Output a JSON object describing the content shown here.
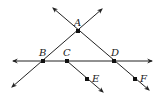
{
  "diagram": {
    "type": "geometry-lines",
    "points": [
      {
        "label": "A",
        "x": 78,
        "y": 31
      },
      {
        "label": "B",
        "x": 43,
        "y": 61
      },
      {
        "label": "C",
        "x": 67,
        "y": 61
      },
      {
        "label": "D",
        "x": 114,
        "y": 61
      },
      {
        "label": "E",
        "x": 87,
        "y": 79
      },
      {
        "label": "F",
        "x": 135,
        "y": 79
      }
    ],
    "lines": [
      {
        "name": "line-BD",
        "kind": "line",
        "through": [
          "B",
          "C",
          "D"
        ]
      },
      {
        "name": "line-AB",
        "kind": "line",
        "through": [
          "A",
          "B"
        ]
      },
      {
        "name": "line-AD",
        "kind": "line",
        "through": [
          "A",
          "D",
          "F"
        ]
      },
      {
        "name": "ray-CE",
        "kind": "ray",
        "through": [
          "C",
          "E"
        ]
      }
    ],
    "labels": {
      "A": "A",
      "B": "B",
      "C": "C",
      "D": "D",
      "E": "E",
      "F": "F"
    },
    "stroke_color": "#222222"
  }
}
